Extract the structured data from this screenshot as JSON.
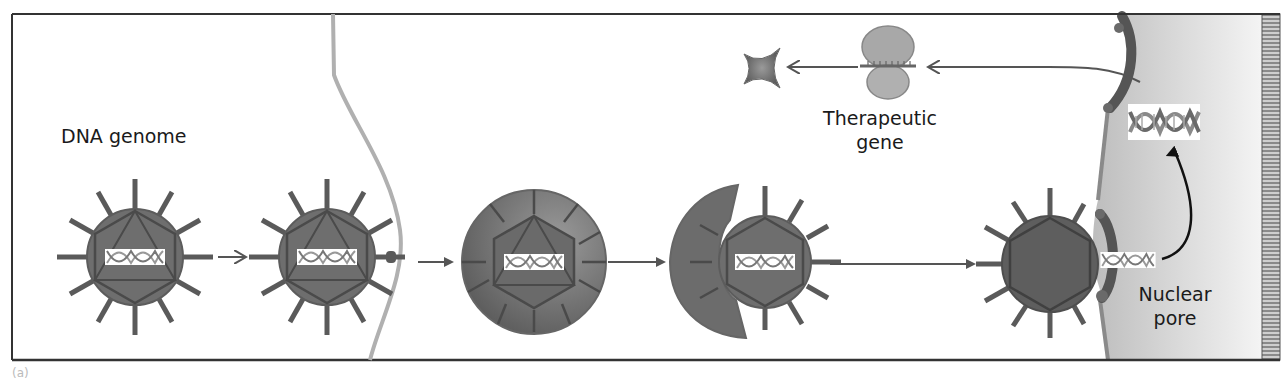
{
  "figure": {
    "panel_label": "(a)",
    "labels": {
      "dna_genome": "DNA genome",
      "therapeutic_gene_line1": "Therapeutic",
      "therapeutic_gene_line2": "gene",
      "nuclear_pore_line1": "Nuclear",
      "nuclear_pore_line2": "pore"
    },
    "stages": [
      {
        "id": "free-virus",
        "description": "Viral vector carrying DNA genome"
      },
      {
        "id": "receptor-binding",
        "description": "Virus binds receptor on cell membrane"
      },
      {
        "id": "endosome",
        "description": "Virus internalized in endosome"
      },
      {
        "id": "endosome-escape",
        "description": "Virus escapes endosome"
      },
      {
        "id": "nuclear-entry",
        "description": "Viral DNA enters nucleus via nuclear pore"
      },
      {
        "id": "transcription",
        "description": "Therapeutic gene transcribed in nucleus"
      },
      {
        "id": "translation",
        "description": "mRNA translated by ribosome"
      },
      {
        "id": "protein",
        "description": "Therapeutic protein produced"
      }
    ],
    "colors": {
      "frame": "#333333",
      "virus_body": "#6e6e6e",
      "virus_edge": "#4a4a4a",
      "spike": "#5a5a5a",
      "membrane": "#b0b0b0",
      "endosome": "#707070",
      "nucleus_fill": "#d4d4d4",
      "nuclear_envelope": "#8a8a8a",
      "pore": "#555555",
      "ribosome": "#a8a8a8",
      "protein": "#777777",
      "arrow": "#555555",
      "text": "#1a1a1a"
    }
  }
}
